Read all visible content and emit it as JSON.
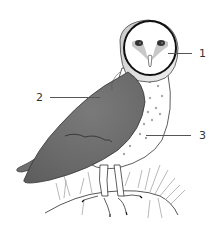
{
  "diagram": {
    "labels": [
      {
        "number": "1",
        "target": "facial disc"
      },
      {
        "number": "2",
        "target": "wing"
      },
      {
        "number": "3",
        "target": "breast"
      }
    ]
  },
  "colors": {
    "wing": "#6f6f6f",
    "wing_dark": "#5a5a5a",
    "outline": "#222222",
    "face": "#ffffff",
    "spots": "#a0a0a0",
    "grass": "#999999",
    "leader": "#555555",
    "label_text": "#333333"
  }
}
